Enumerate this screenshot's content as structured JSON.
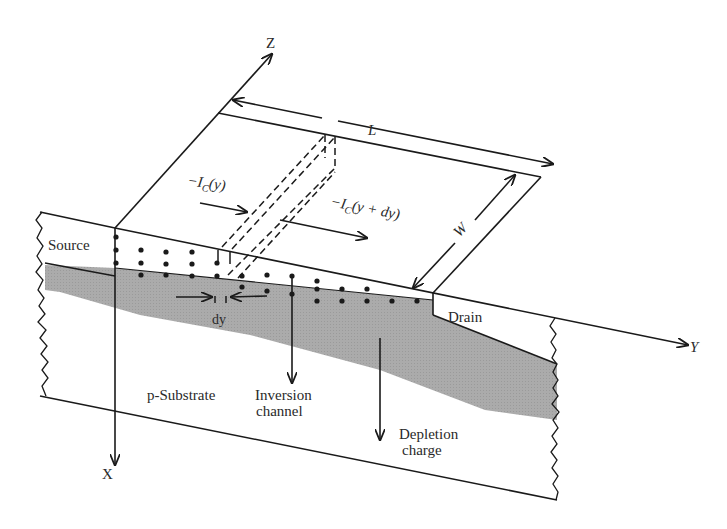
{
  "figure": {
    "axes": {
      "x_label": "X",
      "y_label": "Y",
      "z_label": "Z"
    },
    "dimensions": {
      "length_label": "L",
      "width_label": "W",
      "dy_label": "dy"
    },
    "currents": {
      "ic_y_prefix": "−I",
      "ic_y_sub": "C",
      "ic_y_arg": "(y)",
      "ic_ydy_prefix": "−I",
      "ic_ydy_sub": "C",
      "ic_ydy_arg": "(y + dy)"
    },
    "regions": {
      "source": "Source",
      "drain": "Drain",
      "substrate": "p-Substrate",
      "inversion_line1": "Inversion",
      "inversion_line2": "channel",
      "depletion_line1": "Depletion",
      "depletion_line2": "charge"
    },
    "colors": {
      "line": "#1a1a1a",
      "depletion_fill": "#a9a9a9",
      "background": "#ffffff"
    }
  }
}
